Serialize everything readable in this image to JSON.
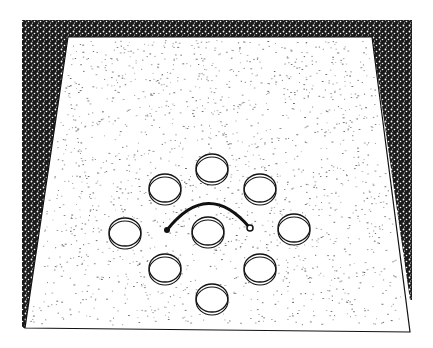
{
  "figure": {
    "description": "Stippled line illustration of an open floor arena viewed in perspective, with nine circular wells arranged as a ring of eight around a central well and a curved arc bar near the center",
    "colors": {
      "background": "#ffffff",
      "ink": "#111111",
      "wall_fill": "#1a1a1a",
      "stipple": "#333333"
    },
    "floor": {
      "outline": [
        [
          25,
          328
        ],
        [
          410,
          332
        ],
        [
          372,
          37
        ],
        [
          68,
          37
        ]
      ],
      "wall_outer": [
        [
          22,
          20
        ],
        [
          412,
          20
        ],
        [
          412,
          332
        ],
        [
          22,
          328
        ]
      ]
    },
    "wells": [
      {
        "name": "top",
        "cx": 212,
        "cy": 168,
        "rx": 16,
        "ry": 14
      },
      {
        "name": "upper-left",
        "cx": 165,
        "cy": 188,
        "rx": 16,
        "ry": 14
      },
      {
        "name": "upper-right",
        "cx": 260,
        "cy": 188,
        "rx": 16,
        "ry": 14
      },
      {
        "name": "left",
        "cx": 125,
        "cy": 232,
        "rx": 16,
        "ry": 14
      },
      {
        "name": "center",
        "cx": 208,
        "cy": 231,
        "rx": 16,
        "ry": 14
      },
      {
        "name": "right",
        "cx": 294,
        "cy": 228,
        "rx": 16,
        "ry": 14
      },
      {
        "name": "lower-left",
        "cx": 165,
        "cy": 268,
        "rx": 16,
        "ry": 14
      },
      {
        "name": "lower-right",
        "cx": 260,
        "cy": 268,
        "rx": 16,
        "ry": 14
      },
      {
        "name": "bottom",
        "cx": 212,
        "cy": 298,
        "rx": 16,
        "ry": 14
      }
    ],
    "arc": {
      "x1": 167,
      "y1": 230,
      "cx": 208,
      "cy": 178,
      "x2": 250,
      "y2": 228
    }
  }
}
